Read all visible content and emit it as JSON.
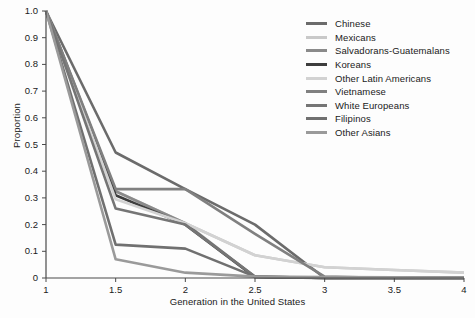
{
  "chart_data": {
    "type": "line",
    "title": "",
    "xlabel": "Generation in the United States",
    "ylabel": "Proportion",
    "xlim": [
      1,
      4
    ],
    "ylim": [
      0,
      1.0
    ],
    "grid": false,
    "legend_position": "top-right",
    "xticks": [
      "1",
      "1.5",
      "2",
      "2.5",
      "3",
      "3.5",
      "4"
    ],
    "xtick_values": [
      1,
      1.5,
      2,
      2.5,
      3,
      3.5,
      4
    ],
    "yticks": [
      "0",
      "0.1",
      "0.2",
      "0.3",
      "0.4",
      "0.5",
      "0.6",
      "0.7",
      "0.8",
      "0.9",
      "1.0"
    ],
    "ytick_values": [
      0,
      0.1,
      0.2,
      0.3,
      0.4,
      0.5,
      0.6,
      0.7,
      0.8,
      0.9,
      1.0
    ],
    "x": [
      1,
      1.5,
      2,
      2.5,
      3,
      3.5,
      4
    ],
    "series": [
      {
        "name": "Chinese",
        "color": "#6b6b6b",
        "values": [
          1.0,
          0.47,
          0.333,
          0.2,
          0.0,
          0.0,
          0.0
        ]
      },
      {
        "name": "Mexicans",
        "color": "#c9c9c9",
        "values": [
          1.0,
          0.325,
          0.205,
          0.085,
          0.04,
          0.03,
          0.02
        ]
      },
      {
        "name": "Salvadorans-Guatemalans",
        "color": "#8a8a8a",
        "values": [
          1.0,
          0.325,
          0.205,
          0.005,
          0.0,
          0.0,
          0.0
        ]
      },
      {
        "name": "Koreans",
        "color": "#3d3d3d",
        "values": [
          1.0,
          0.31,
          0.2,
          0.003,
          0.0,
          0.0,
          0.0
        ]
      },
      {
        "name": "Other Latin Americans",
        "color": "#d2d2d2",
        "values": [
          1.0,
          0.295,
          0.205,
          0.085,
          0.04,
          0.03,
          0.02
        ]
      },
      {
        "name": "Vietnamese",
        "color": "#808080",
        "values": [
          1.0,
          0.333,
          0.333,
          0.165,
          0.005,
          0.0,
          0.0
        ]
      },
      {
        "name": "White Europeans",
        "color": "#757575",
        "values": [
          1.0,
          0.26,
          0.2,
          0.005,
          0.0,
          0.0,
          0.0
        ]
      },
      {
        "name": "Filipinos",
        "color": "#707070",
        "values": [
          1.0,
          0.125,
          0.11,
          0.005,
          0.0,
          0.0,
          0.0
        ]
      },
      {
        "name": "Other Asians",
        "color": "#9a9a9a",
        "values": [
          1.0,
          0.07,
          0.02,
          0.005,
          0.004,
          0.003,
          0.002
        ]
      }
    ]
  },
  "axes": {
    "x_title": "Generation in the United States",
    "y_title": "Proportion"
  }
}
